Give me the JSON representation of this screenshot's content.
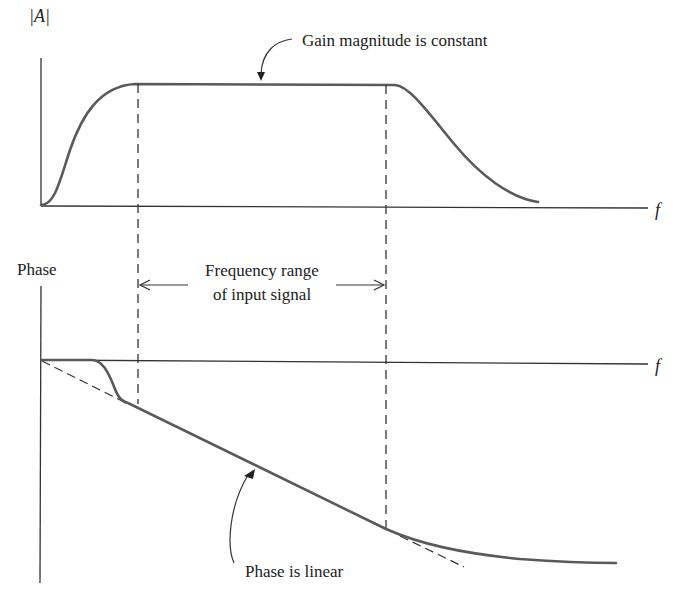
{
  "figure": {
    "magnitude_plot": {
      "y_label": "|A|",
      "x_label": "f",
      "annotation": "Gain magnitude is constant"
    },
    "phase_plot": {
      "y_label": "Phase",
      "x_label": "f",
      "annotation": "Phase is linear"
    },
    "range_annotation": {
      "line1": "Frequency range",
      "line2": "of input signal"
    },
    "colors": {
      "curve": "#5a5a5a",
      "axes": "#333333",
      "text": "#222222",
      "background": "#ffffff"
    }
  }
}
